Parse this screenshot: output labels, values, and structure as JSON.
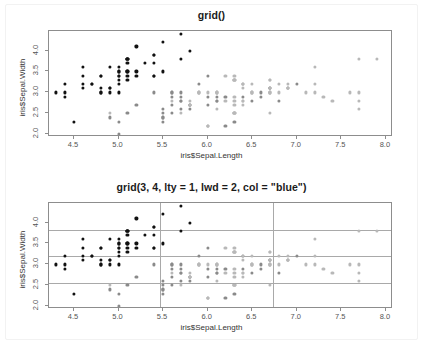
{
  "chart_data": [
    {
      "type": "scatter",
      "title": "grid()",
      "xlabel": "iris$Sepal.Length",
      "ylabel": "iris$Sepal.Width",
      "xlim": [
        4.22,
        8.08
      ],
      "ylim": [
        1.93,
        4.47
      ],
      "xticks": [
        4.5,
        5.0,
        5.5,
        6.0,
        6.5,
        7.0,
        7.5,
        8.0
      ],
      "yticks": [
        2.0,
        2.5,
        3.0,
        3.5,
        4.0
      ],
      "xticklabels": [
        "4.5",
        "5.0",
        "5.5",
        "6.0",
        "6.5",
        "7.0",
        "7.5",
        "8.0"
      ],
      "yticklabels": [
        "2.0",
        "2.5",
        "3.0",
        "3.5",
        "4.0"
      ],
      "grid": false,
      "legend": "none",
      "point_colors": [
        "#111111",
        "#8a8a8a",
        "#b8b8b8"
      ],
      "series": [
        {
          "name": "setosa",
          "color": "#111111",
          "x": [
            5.1,
            4.9,
            4.7,
            4.6,
            5.0,
            5.4,
            4.6,
            5.0,
            4.4,
            4.9,
            5.4,
            4.8,
            4.8,
            4.3,
            5.8,
            5.7,
            5.4,
            5.1,
            5.7,
            5.1,
            5.4,
            5.1,
            4.6,
            5.1,
            4.8,
            5.0,
            5.0,
            5.2,
            5.2,
            4.7,
            4.8,
            5.4,
            5.2,
            5.5,
            4.9,
            5.0,
            5.5,
            4.9,
            4.4,
            5.1,
            5.0,
            4.5,
            4.4,
            5.0,
            5.1,
            4.8,
            5.1,
            4.6,
            5.3,
            5.0
          ],
          "y": [
            3.5,
            3.0,
            3.2,
            3.1,
            3.6,
            3.9,
            3.4,
            3.4,
            2.9,
            3.1,
            3.7,
            3.4,
            3.0,
            3.0,
            4.0,
            4.4,
            3.9,
            3.5,
            3.8,
            3.8,
            3.4,
            3.7,
            3.6,
            3.3,
            3.4,
            3.0,
            3.4,
            3.5,
            3.4,
            3.2,
            3.1,
            3.4,
            4.1,
            4.2,
            3.1,
            3.2,
            3.5,
            3.6,
            3.0,
            3.4,
            3.5,
            2.3,
            3.2,
            3.5,
            3.8,
            3.0,
            3.8,
            3.2,
            3.7,
            3.3
          ]
        },
        {
          "name": "versicolor",
          "color": "#8a8a8a",
          "x": [
            7.0,
            6.4,
            6.9,
            5.5,
            6.5,
            5.7,
            6.3,
            4.9,
            6.6,
            5.2,
            5.0,
            5.9,
            6.0,
            6.1,
            5.6,
            6.7,
            5.6,
            5.8,
            6.2,
            5.6,
            5.9,
            6.1,
            6.3,
            6.1,
            6.4,
            6.6,
            6.8,
            6.7,
            6.0,
            5.7,
            5.5,
            5.5,
            5.8,
            6.0,
            5.4,
            6.0,
            6.7,
            6.3,
            5.6,
            5.5,
            5.5,
            6.1,
            5.8,
            5.0,
            5.6,
            5.7,
            5.7,
            6.2,
            5.1,
            5.7
          ],
          "y": [
            3.2,
            3.2,
            3.1,
            2.3,
            2.8,
            2.8,
            3.3,
            2.4,
            2.9,
            2.7,
            2.0,
            3.0,
            2.2,
            2.9,
            2.9,
            3.1,
            3.0,
            2.7,
            2.2,
            2.5,
            3.2,
            2.8,
            2.5,
            2.8,
            2.9,
            3.0,
            2.8,
            3.0,
            2.9,
            2.6,
            2.4,
            2.4,
            2.7,
            2.7,
            3.0,
            3.4,
            3.1,
            2.3,
            3.0,
            2.5,
            2.6,
            3.0,
            2.6,
            2.3,
            2.7,
            3.0,
            2.9,
            2.9,
            2.5,
            2.8
          ]
        },
        {
          "name": "virginica",
          "color": "#b8b8b8",
          "x": [
            6.3,
            5.8,
            7.1,
            6.3,
            6.5,
            7.6,
            4.9,
            7.3,
            6.7,
            7.2,
            6.5,
            6.4,
            6.8,
            5.7,
            5.8,
            6.4,
            6.5,
            7.7,
            7.7,
            6.0,
            6.9,
            5.6,
            7.7,
            6.3,
            6.7,
            7.2,
            6.2,
            6.1,
            6.4,
            7.2,
            7.4,
            7.9,
            6.4,
            6.3,
            6.1,
            7.7,
            6.3,
            6.4,
            6.0,
            6.9,
            6.7,
            6.9,
            5.8,
            6.8,
            6.7,
            6.7,
            6.3,
            6.5,
            6.2,
            5.9
          ],
          "y": [
            3.3,
            2.7,
            3.0,
            2.9,
            3.0,
            3.0,
            2.5,
            2.9,
            2.5,
            3.6,
            3.2,
            2.7,
            3.0,
            2.5,
            2.8,
            3.2,
            3.0,
            3.8,
            2.6,
            2.2,
            3.2,
            2.8,
            2.8,
            2.7,
            3.3,
            3.2,
            2.8,
            3.0,
            2.8,
            3.0,
            2.8,
            3.8,
            2.8,
            2.8,
            2.6,
            3.0,
            3.4,
            3.1,
            3.0,
            3.1,
            3.1,
            3.1,
            2.7,
            3.2,
            3.3,
            3.0,
            2.5,
            3.0,
            3.4,
            3.0
          ]
        }
      ]
    },
    {
      "type": "scatter",
      "title": "grid(3, 4, lty = 1, lwd = 2, col = \"blue\")",
      "xlabel": "iris$Sepal.Length",
      "ylabel": "iris$Sepal.Width",
      "xlim": [
        4.22,
        8.08
      ],
      "ylim": [
        1.93,
        4.47
      ],
      "xticks": [
        4.5,
        5.0,
        5.5,
        6.0,
        6.5,
        7.0,
        7.5,
        8.0
      ],
      "yticks": [
        2.0,
        2.5,
        3.0,
        3.5,
        4.0
      ],
      "xticklabels": [
        "4.5",
        "5.0",
        "5.5",
        "6.0",
        "6.5",
        "7.0",
        "7.5",
        "8.0"
      ],
      "yticklabels": [
        "2.0",
        "2.5",
        "3.0",
        "3.5",
        "4.0"
      ],
      "grid": true,
      "grid_color": "#a9a9a9",
      "grid_nx": 3,
      "grid_ny": 4,
      "grid_lty": 1,
      "grid_lwd": 2,
      "grid_vlines": [
        5.4667,
        6.7333
      ],
      "grid_hlines": [
        2.565,
        3.2,
        3.835
      ],
      "legend": "none",
      "point_colors": [
        "#111111",
        "#8a8a8a",
        "#b8b8b8"
      ],
      "series": [
        {
          "name": "setosa",
          "color": "#111111",
          "x": [
            5.1,
            4.9,
            4.7,
            4.6,
            5.0,
            5.4,
            4.6,
            5.0,
            4.4,
            4.9,
            5.4,
            4.8,
            4.8,
            4.3,
            5.8,
            5.7,
            5.4,
            5.1,
            5.7,
            5.1,
            5.4,
            5.1,
            4.6,
            5.1,
            4.8,
            5.0,
            5.0,
            5.2,
            5.2,
            4.7,
            4.8,
            5.4,
            5.2,
            5.5,
            4.9,
            5.0,
            5.5,
            4.9,
            4.4,
            5.1,
            5.0,
            4.5,
            4.4,
            5.0,
            5.1,
            4.8,
            5.1,
            4.6,
            5.3,
            5.0
          ],
          "y": [
            3.5,
            3.0,
            3.2,
            3.1,
            3.6,
            3.9,
            3.4,
            3.4,
            2.9,
            3.1,
            3.7,
            3.4,
            3.0,
            3.0,
            4.0,
            4.4,
            3.9,
            3.5,
            3.8,
            3.8,
            3.4,
            3.7,
            3.6,
            3.3,
            3.4,
            3.0,
            3.4,
            3.5,
            3.4,
            3.2,
            3.1,
            3.4,
            4.1,
            4.2,
            3.1,
            3.2,
            3.5,
            3.6,
            3.0,
            3.4,
            3.5,
            2.3,
            3.2,
            3.5,
            3.8,
            3.0,
            3.8,
            3.2,
            3.7,
            3.3
          ]
        },
        {
          "name": "versicolor",
          "color": "#8a8a8a",
          "x": [
            7.0,
            6.4,
            6.9,
            5.5,
            6.5,
            5.7,
            6.3,
            4.9,
            6.6,
            5.2,
            5.0,
            5.9,
            6.0,
            6.1,
            5.6,
            6.7,
            5.6,
            5.8,
            6.2,
            5.6,
            5.9,
            6.1,
            6.3,
            6.1,
            6.4,
            6.6,
            6.8,
            6.7,
            6.0,
            5.7,
            5.5,
            5.5,
            5.8,
            6.0,
            5.4,
            6.0,
            6.7,
            6.3,
            5.6,
            5.5,
            5.5,
            6.1,
            5.8,
            5.0,
            5.6,
            5.7,
            5.7,
            6.2,
            5.1,
            5.7
          ],
          "y": [
            3.2,
            3.2,
            3.1,
            2.3,
            2.8,
            2.8,
            3.3,
            2.4,
            2.9,
            2.7,
            2.0,
            3.0,
            2.2,
            2.9,
            2.9,
            3.1,
            3.0,
            2.7,
            2.2,
            2.5,
            3.2,
            2.8,
            2.5,
            2.8,
            2.9,
            3.0,
            2.8,
            3.0,
            2.9,
            2.6,
            2.4,
            2.4,
            2.7,
            2.7,
            3.0,
            3.4,
            3.1,
            2.3,
            3.0,
            2.5,
            2.6,
            3.0,
            2.6,
            2.3,
            2.7,
            3.0,
            2.9,
            2.9,
            2.5,
            2.8
          ]
        },
        {
          "name": "virginica",
          "color": "#b8b8b8",
          "x": [
            6.3,
            5.8,
            7.1,
            6.3,
            6.5,
            7.6,
            4.9,
            7.3,
            6.7,
            7.2,
            6.5,
            6.4,
            6.8,
            5.7,
            5.8,
            6.4,
            6.5,
            7.7,
            7.7,
            6.0,
            6.9,
            5.6,
            7.7,
            6.3,
            6.7,
            7.2,
            6.2,
            6.1,
            6.4,
            7.2,
            7.4,
            7.9,
            6.4,
            6.3,
            6.1,
            7.7,
            6.3,
            6.4,
            6.0,
            6.9,
            6.7,
            6.9,
            5.8,
            6.8,
            6.7,
            6.7,
            6.3,
            6.5,
            6.2,
            5.9
          ],
          "y": [
            3.3,
            2.7,
            3.0,
            2.9,
            3.0,
            3.0,
            2.5,
            2.9,
            2.5,
            3.6,
            3.2,
            2.7,
            3.0,
            2.5,
            2.8,
            3.2,
            3.0,
            3.8,
            2.6,
            2.2,
            3.2,
            2.8,
            2.8,
            2.7,
            3.3,
            3.2,
            2.8,
            3.0,
            2.8,
            3.0,
            2.8,
            3.8,
            2.8,
            2.8,
            2.6,
            3.0,
            3.4,
            3.1,
            3.0,
            3.1,
            3.1,
            3.1,
            2.7,
            3.2,
            3.3,
            3.0,
            2.5,
            3.0,
            3.4,
            3.0
          ]
        }
      ]
    }
  ]
}
